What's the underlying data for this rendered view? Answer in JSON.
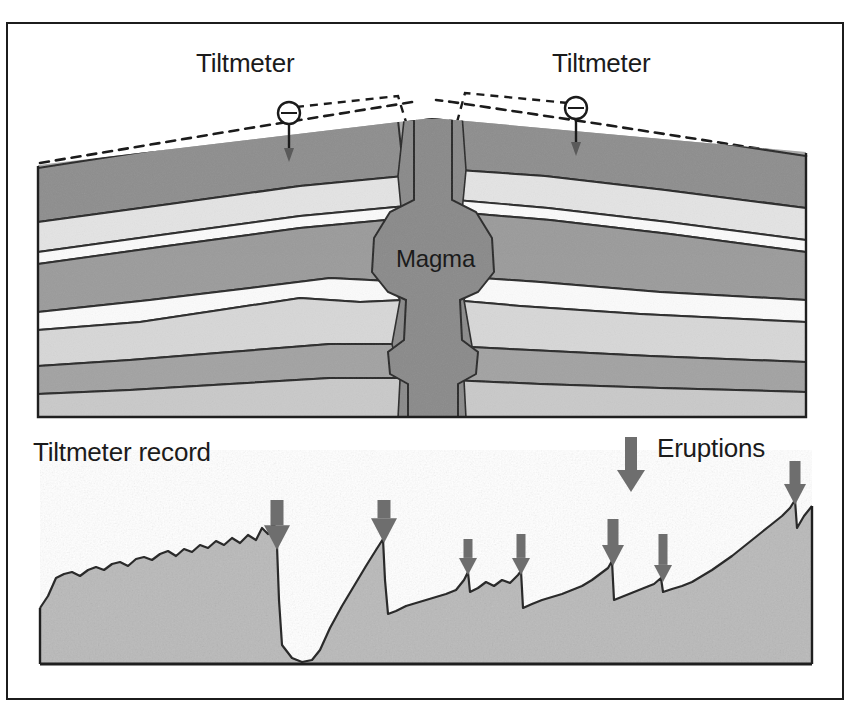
{
  "figure": {
    "background_color": "#ffffff",
    "frame_color": "#1c1c1c",
    "title_left": "Tiltmeter",
    "title_right": "Tiltmeter",
    "magma_label": "Magma",
    "record_label": "Tiltmeter record",
    "eruptions_label": "Eruptions"
  },
  "palette": {
    "ink": "#1b1b1b",
    "outline": "#2a2a2a",
    "layer_dark": "#8e8e8e",
    "layer_mid": "#a8a8a8",
    "layer_light": "#c9c9c9",
    "layer_pale": "#e4e4e4",
    "layer_white": "#fbfbfb",
    "magma_fill": "#8a8a8a",
    "graph_fill": "#b9b9b9",
    "arrow_fill": "#6e6e6e"
  },
  "cross_section": {
    "name": "volcano-cross-section",
    "bounds": {
      "x": 38,
      "y": 148,
      "width": 768,
      "height": 268
    },
    "ground_surface_note": "inflated dome profile, dashed pre-inflation surface above",
    "dashed_surface_color": "#1b1b1b",
    "conduit": {
      "name": "magma-conduit",
      "center_x": 432,
      "top_y": 120,
      "bottom_y": 416,
      "label": "Magma"
    },
    "tiltmeters": [
      {
        "name": "tiltmeter-left",
        "x": 289,
        "y": 113,
        "stem_bottom_y": 160,
        "label": "Tiltmeter"
      },
      {
        "name": "tiltmeter-right",
        "x": 576,
        "y": 108,
        "stem_bottom_y": 152,
        "label": "Tiltmeter"
      }
    ],
    "strata_count": 9
  },
  "chart_data": {
    "type": "area",
    "title": "Tiltmeter record",
    "xlabel": "",
    "ylabel": "",
    "grid": false,
    "legend": [
      {
        "label": "Eruptions",
        "marker": "down-arrow",
        "color": "#6e6e6e"
      }
    ],
    "baseline_y": 663,
    "plot_bounds": {
      "x": 40,
      "y": 500,
      "width": 772,
      "height": 163
    },
    "series": [
      {
        "name": "Tilt",
        "description": "Ground tilt slowly inflates then drops abruptly at each eruption",
        "points": [
          [
            40,
            608
          ],
          [
            48,
            596
          ],
          [
            56,
            578
          ],
          [
            64,
            574
          ],
          [
            72,
            572
          ],
          [
            80,
            576
          ],
          [
            88,
            570
          ],
          [
            96,
            567
          ],
          [
            104,
            570
          ],
          [
            112,
            564
          ],
          [
            120,
            562
          ],
          [
            128,
            566
          ],
          [
            136,
            559
          ],
          [
            144,
            557
          ],
          [
            152,
            560
          ],
          [
            160,
            554
          ],
          [
            168,
            551
          ],
          [
            176,
            556
          ],
          [
            184,
            549
          ],
          [
            192,
            552
          ],
          [
            200,
            545
          ],
          [
            208,
            548
          ],
          [
            216,
            541
          ],
          [
            224,
            545
          ],
          [
            232,
            538
          ],
          [
            240,
            543
          ],
          [
            248,
            535
          ],
          [
            256,
            540
          ],
          [
            262,
            528
          ],
          [
            268,
            534
          ],
          [
            274,
            522
          ],
          [
            277,
            546
          ],
          [
            279,
            600
          ],
          [
            282,
            645
          ],
          [
            292,
            658
          ],
          [
            302,
            662
          ],
          [
            312,
            660
          ],
          [
            320,
            650
          ],
          [
            330,
            628
          ],
          [
            342,
            606
          ],
          [
            354,
            586
          ],
          [
            366,
            566
          ],
          [
            376,
            550
          ],
          [
            383,
            539
          ],
          [
            385,
            580
          ],
          [
            388,
            614
          ],
          [
            396,
            611
          ],
          [
            406,
            606
          ],
          [
            416,
            603
          ],
          [
            426,
            600
          ],
          [
            436,
            597
          ],
          [
            446,
            594
          ],
          [
            456,
            590
          ],
          [
            464,
            580
          ],
          [
            468,
            572
          ],
          [
            470,
            592
          ],
          [
            478,
            588
          ],
          [
            486,
            582
          ],
          [
            494,
            586
          ],
          [
            502,
            580
          ],
          [
            510,
            583
          ],
          [
            518,
            575
          ],
          [
            521,
            571
          ],
          [
            523,
            608
          ],
          [
            532,
            604
          ],
          [
            542,
            600
          ],
          [
            552,
            597
          ],
          [
            562,
            594
          ],
          [
            572,
            590
          ],
          [
            582,
            586
          ],
          [
            592,
            580
          ],
          [
            600,
            574
          ],
          [
            608,
            568
          ],
          [
            612,
            561
          ],
          [
            614,
            600
          ],
          [
            624,
            596
          ],
          [
            634,
            592
          ],
          [
            644,
            588
          ],
          [
            654,
            584
          ],
          [
            661,
            578
          ],
          [
            663,
            592
          ],
          [
            672,
            589
          ],
          [
            682,
            586
          ],
          [
            692,
            582
          ],
          [
            702,
            576
          ],
          [
            712,
            570
          ],
          [
            722,
            563
          ],
          [
            732,
            556
          ],
          [
            742,
            548
          ],
          [
            752,
            540
          ],
          [
            762,
            532
          ],
          [
            772,
            524
          ],
          [
            782,
            516
          ],
          [
            790,
            508
          ],
          [
            795,
            500
          ],
          [
            797,
            528
          ],
          [
            804,
            516
          ],
          [
            812,
            506
          ]
        ]
      }
    ],
    "eruption_arrows": [
      {
        "x": 277,
        "tip_y": 550,
        "top_y": 500,
        "size": "large"
      },
      {
        "x": 384,
        "tip_y": 543,
        "top_y": 500,
        "size": "large"
      },
      {
        "x": 468,
        "tip_y": 575,
        "top_y": 539,
        "size": "small"
      },
      {
        "x": 521,
        "tip_y": 575,
        "top_y": 534,
        "size": "small"
      },
      {
        "x": 613,
        "tip_y": 566,
        "top_y": 519,
        "size": "medium"
      },
      {
        "x": 663,
        "tip_y": 582,
        "top_y": 534,
        "size": "small"
      },
      {
        "x": 795,
        "tip_y": 505,
        "top_y": 461,
        "size": "medium"
      }
    ],
    "legend_arrow": {
      "x": 631,
      "tip_y": 489,
      "top_y": 437
    }
  }
}
